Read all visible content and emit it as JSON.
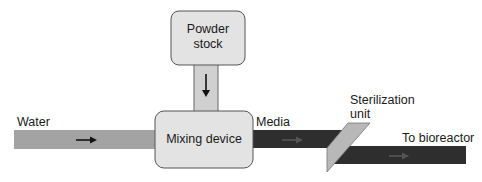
{
  "diagram": {
    "type": "process-flow",
    "nodes": {
      "powder_stock": {
        "label_line1": "Powder",
        "label_line2": "stock"
      },
      "mixing_device": {
        "label": "Mixing device"
      },
      "sterilization_unit": {
        "label_line1": "Sterilization",
        "label_line2": "unit"
      }
    },
    "streams": {
      "water": {
        "label": "Water",
        "color": "#a3a3a3"
      },
      "powder_feed": {
        "label": "",
        "color": "#d0d0d0"
      },
      "media": {
        "label": "Media",
        "color": "#2e2e2e"
      },
      "to_bioreactor": {
        "label": "To bioreactor",
        "color": "#2e2e2e"
      }
    },
    "edges": [
      {
        "from": "Water",
        "to": "Mixing device"
      },
      {
        "from": "Powder stock",
        "to": "Mixing device"
      },
      {
        "from": "Mixing device",
        "to": "Sterilization unit",
        "label": "Media"
      },
      {
        "from": "Sterilization unit",
        "to": "Bioreactor",
        "label": "To bioreactor"
      }
    ],
    "colors": {
      "box_fill": "#e3e3e3",
      "box_stroke": "#555555",
      "sterilizer_fill": "#b8b8b8",
      "arrow": "#111111"
    }
  }
}
